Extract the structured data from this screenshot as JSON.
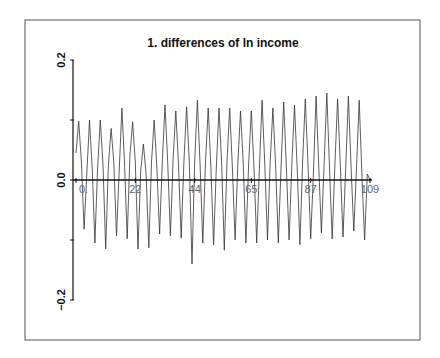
{
  "chart_data": {
    "type": "line",
    "title": "1. differences of ln income",
    "xlabel": "",
    "ylabel": "",
    "xlim": [
      0,
      109
    ],
    "ylim": [
      -0.2,
      0.2
    ],
    "x_ticks": [
      0,
      22,
      44,
      65,
      87,
      109
    ],
    "x_tick_labels": [
      "0.",
      "22",
      "44",
      "65",
      "87",
      "109"
    ],
    "y_ticks": [
      -0.2,
      -0.1,
      0.0,
      0.1,
      0.2
    ],
    "y_tick_labels": [
      "-0.2",
      "",
      "0.0",
      "",
      "0.2"
    ],
    "grid": false,
    "legend": null,
    "series": [
      {
        "name": "differences of ln income",
        "x": [
          0,
          1,
          2,
          3,
          4,
          5,
          6,
          7,
          8,
          9,
          10,
          11,
          12,
          13,
          14,
          15,
          16,
          17,
          18,
          19,
          20,
          21,
          22,
          23,
          24,
          25,
          26,
          27,
          28,
          29,
          30,
          31,
          32,
          33,
          34,
          35,
          36,
          37,
          38,
          39,
          40,
          41,
          42,
          43,
          44,
          45,
          46,
          47,
          48,
          49,
          50,
          51,
          52,
          53,
          54,
          55,
          56,
          57,
          58,
          59,
          60,
          61,
          62,
          63,
          64,
          65,
          66,
          67,
          68,
          69,
          70,
          71,
          72,
          73,
          74,
          75,
          76,
          77,
          78,
          79,
          80,
          81,
          82,
          83,
          84,
          85,
          86,
          87,
          88,
          89,
          90,
          91,
          92,
          93,
          94,
          95,
          96,
          97,
          98,
          99,
          100,
          101,
          102,
          103,
          104,
          105,
          106,
          107,
          108,
          109
        ],
        "values": [
          0.045,
          0.098,
          0.03,
          -0.082,
          0.01,
          0.1,
          0.02,
          -0.105,
          0.02,
          0.1,
          0.025,
          -0.115,
          0.025,
          0.086,
          0.03,
          -0.093,
          0.015,
          0.12,
          0.025,
          -0.098,
          0.04,
          0.097,
          0.03,
          -0.115,
          0.015,
          0.06,
          0.01,
          -0.113,
          0.03,
          0.1,
          0.02,
          -0.09,
          0.03,
          0.125,
          0.03,
          -0.093,
          0.035,
          0.115,
          0.025,
          -0.097,
          0.03,
          0.122,
          0.03,
          -0.14,
          0.03,
          0.133,
          0.025,
          -0.105,
          0.03,
          0.12,
          0.02,
          -0.108,
          0.02,
          0.12,
          0.025,
          -0.117,
          0.03,
          0.12,
          0.02,
          -0.1,
          0.025,
          0.115,
          0.03,
          -0.105,
          0.025,
          0.115,
          0.02,
          -0.105,
          0.02,
          0.133,
          0.025,
          -0.1,
          0.03,
          0.12,
          0.025,
          -0.105,
          0.02,
          0.13,
          0.02,
          -0.1,
          0.025,
          0.125,
          0.02,
          -0.108,
          0.03,
          0.135,
          0.025,
          -0.098,
          0.01,
          0.14,
          0.02,
          -0.088,
          0.025,
          0.145,
          0.02,
          -0.098,
          0.025,
          0.135,
          0.025,
          -0.095,
          0.02,
          0.14,
          0.02,
          -0.085,
          0.02,
          0.133,
          0.01,
          -0.1,
          0.01,
          0.0
        ]
      }
    ]
  },
  "colors": {
    "background": "#ffffff",
    "frame": "#555555",
    "axis": "#111111",
    "series_line": "#333333",
    "text": "#111111"
  }
}
